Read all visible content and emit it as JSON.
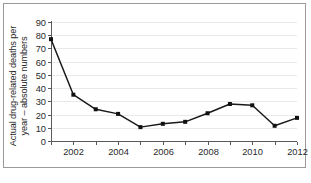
{
  "chart_data": {
    "type": "line",
    "title": "",
    "xlabel": "",
    "ylabel": "Actual drug-related deaths per year – absolute numbers",
    "ylabel_line1": "Actual drug-related deaths per",
    "ylabel_line2": "year – absolute numbers",
    "x": [
      2001,
      2002,
      2003,
      2004,
      2005,
      2006,
      2007,
      2008,
      2009,
      2010,
      2011,
      2012
    ],
    "values": [
      77,
      35,
      24,
      20.5,
      10.5,
      13,
      14.5,
      21,
      28,
      27,
      11.5,
      17.5
    ],
    "series": [
      {
        "name": "Actual drug-related deaths per year",
        "values": [
          77,
          35,
          24,
          20.5,
          10.5,
          13,
          14.5,
          21,
          28,
          27,
          11.5,
          17.5
        ]
      }
    ],
    "xlim": [
      2001,
      2012
    ],
    "ylim": [
      0,
      90
    ],
    "ytick_labels": [
      "90",
      "80",
      "70",
      "60",
      "50",
      "40",
      "30",
      "20",
      "10",
      "0"
    ],
    "ytick_values": [
      90,
      80,
      70,
      60,
      50,
      40,
      30,
      20,
      10,
      0
    ],
    "xtick_values": [
      2001,
      2002,
      2003,
      2004,
      2005,
      2006,
      2007,
      2008,
      2009,
      2010,
      2011,
      2012
    ],
    "xtick_labels": [
      "",
      "2002",
      "",
      "2004",
      "",
      "2006",
      "",
      "2008",
      "",
      "2010",
      "",
      "2012"
    ],
    "grid": true,
    "grid_axis": "y",
    "legend": false,
    "legend_position": "none",
    "marker": "square",
    "line_color": "#1a1a1a",
    "marker_color": "#111111",
    "grid_color": "#e9e9e9",
    "axis_color": "#5a5a5a",
    "background_color": "#ffffff",
    "border_color": "#9a9a9a"
  }
}
